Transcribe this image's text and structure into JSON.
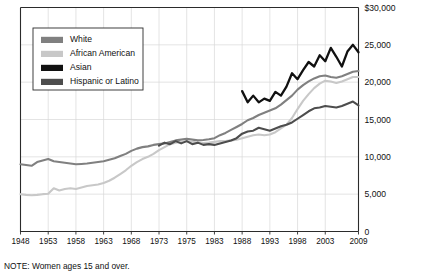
{
  "note": "NOTE: Women ages 15 and over.",
  "legend": {
    "position": "top-left-inside",
    "items": [
      {
        "label": "White",
        "color": "#808080"
      },
      {
        "label": "African American",
        "color": "#c8c8c8"
      },
      {
        "label": "Asian",
        "color": "#111111"
      },
      {
        "label": "Hispanic or Latino",
        "color": "#4d4d4d"
      }
    ]
  },
  "axes": {
    "y_ticks": [
      "$30,000",
      "25,000",
      "20,000",
      "15,000",
      "10,000",
      "5,000",
      "0"
    ],
    "x_ticks": [
      "1948",
      "1953",
      "1958",
      "1963",
      "1968",
      "1973",
      "1975",
      "1983",
      "1988",
      "1993",
      "1998",
      "2003",
      "2009"
    ]
  },
  "chart_data": {
    "type": "line",
    "title": "",
    "subtitle": "",
    "xlabel": "",
    "ylabel": "",
    "ylim": [
      0,
      30000
    ],
    "y_tick_values": [
      0,
      5000,
      10000,
      15000,
      20000,
      25000,
      30000
    ],
    "grid": true,
    "legend_position": "top-left-inside",
    "annotations": [
      "NOTE: Women ages 15 and over."
    ],
    "x_tick_labels": [
      "1948",
      "1953",
      "1958",
      "1963",
      "1968",
      "1973",
      "1975",
      "1983",
      "1988",
      "1993",
      "1998",
      "2003",
      "2009"
    ],
    "x_tick_positions": [
      1948,
      1953,
      1958,
      1963,
      1968,
      1973,
      1978,
      1983,
      1988,
      1993,
      1998,
      2003,
      2009
    ],
    "x": [
      1948,
      1949,
      1950,
      1951,
      1952,
      1953,
      1954,
      1955,
      1956,
      1957,
      1958,
      1959,
      1960,
      1961,
      1962,
      1963,
      1964,
      1965,
      1966,
      1967,
      1968,
      1969,
      1970,
      1971,
      1972,
      1973,
      1974,
      1975,
      1976,
      1977,
      1978,
      1979,
      1980,
      1981,
      1982,
      1983,
      1984,
      1985,
      1986,
      1987,
      1988,
      1989,
      1990,
      1991,
      1992,
      1993,
      1994,
      1995,
      1996,
      1997,
      1998,
      1999,
      2000,
      2001,
      2002,
      2003,
      2004,
      2005,
      2006,
      2007,
      2008,
      2009
    ],
    "series": [
      {
        "name": "White",
        "color": "#808080",
        "values": [
          9000,
          8900,
          8800,
          9300,
          9500,
          9700,
          9400,
          9300,
          9200,
          9100,
          9000,
          9050,
          9100,
          9200,
          9300,
          9400,
          9600,
          9800,
          10100,
          10400,
          10800,
          11100,
          11300,
          11400,
          11600,
          11700,
          11800,
          12000,
          12200,
          12300,
          12400,
          12300,
          12200,
          12250,
          12350,
          12500,
          12900,
          13200,
          13600,
          14000,
          14400,
          14900,
          15200,
          15600,
          15900,
          16200,
          16500,
          17000,
          17600,
          18200,
          19000,
          19600,
          20100,
          20500,
          20800,
          20900,
          20700,
          20600,
          20800,
          21100,
          21400,
          21500
        ]
      },
      {
        "name": "African American",
        "color": "#c8c8c8",
        "values": [
          5000,
          4900,
          4850,
          4900,
          5000,
          5050,
          5800,
          5500,
          5700,
          5800,
          5700,
          5900,
          6100,
          6200,
          6300,
          6500,
          6800,
          7200,
          7700,
          8200,
          8800,
          9300,
          9700,
          10000,
          10400,
          10900,
          11300,
          11700,
          11900,
          12000,
          12100,
          12000,
          11900,
          11850,
          11900,
          12000,
          12100,
          12100,
          12200,
          12300,
          12500,
          12700,
          12900,
          13000,
          12900,
          13000,
          13300,
          13800,
          14300,
          15200,
          16400,
          17500,
          18400,
          19200,
          19800,
          20200,
          20100,
          19900,
          20100,
          20400,
          20700,
          20700
        ]
      },
      {
        "name": "Asian",
        "color": "#111111",
        "values": [
          null,
          null,
          null,
          null,
          null,
          null,
          null,
          null,
          null,
          null,
          null,
          null,
          null,
          null,
          null,
          null,
          null,
          null,
          null,
          null,
          null,
          null,
          null,
          null,
          null,
          null,
          null,
          null,
          null,
          null,
          null,
          null,
          null,
          null,
          null,
          null,
          null,
          null,
          null,
          null,
          18800,
          17300,
          18200,
          17300,
          17800,
          17500,
          18700,
          18200,
          19400,
          21200,
          20400,
          21600,
          22700,
          22100,
          23600,
          22800,
          24600,
          23400,
          22100,
          24100,
          25000,
          24000
        ]
      },
      {
        "name": "Hispanic or Latino",
        "color": "#4d4d4d",
        "values": [
          null,
          null,
          null,
          null,
          null,
          null,
          null,
          null,
          null,
          null,
          null,
          null,
          null,
          null,
          null,
          null,
          null,
          null,
          null,
          null,
          null,
          null,
          null,
          null,
          null,
          11500,
          11900,
          11700,
          12100,
          11800,
          12100,
          11700,
          11900,
          11600,
          11700,
          11600,
          11800,
          12000,
          12200,
          12500,
          13100,
          13400,
          13500,
          13900,
          13700,
          13500,
          13800,
          14100,
          14300,
          14600,
          15100,
          15600,
          16100,
          16500,
          16600,
          16800,
          16700,
          16600,
          16800,
          17100,
          17400,
          16900
        ]
      }
    ]
  }
}
